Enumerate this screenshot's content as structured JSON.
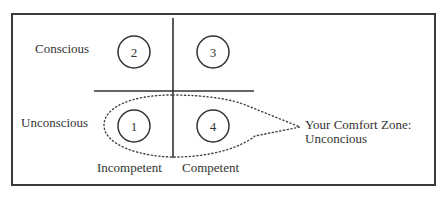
{
  "diagram": {
    "type": "competence-consciousness-matrix",
    "rows": [
      {
        "label": "Conscious"
      },
      {
        "label": "Unconscious"
      }
    ],
    "columns": [
      {
        "label": "Incompetent"
      },
      {
        "label": "Competent"
      }
    ],
    "quadrants": [
      {
        "number": "2",
        "row": "Conscious",
        "column": "Incompetent"
      },
      {
        "number": "3",
        "row": "Conscious",
        "column": "Competent"
      },
      {
        "number": "1",
        "row": "Unconscious",
        "column": "Incompetent"
      },
      {
        "number": "4",
        "row": "Unconscious",
        "column": "Competent"
      }
    ],
    "callout": {
      "line1": "Your Comfort Zone:",
      "line2": "Unconcious",
      "style": "dotted"
    },
    "colors": {
      "stroke": "#333333",
      "text": "#333333",
      "background": "#ffffff"
    }
  }
}
